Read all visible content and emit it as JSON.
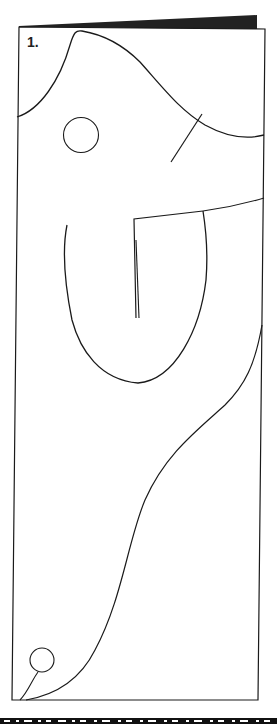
{
  "figure": {
    "label": "1.",
    "stroke_color": "#1a1a1a",
    "panel_shadow_color": "#222222",
    "background": "#ffffff"
  },
  "shapes": [
    {
      "name": "panel-frame",
      "type": "rect"
    },
    {
      "name": "panel-top-shadow",
      "type": "band"
    },
    {
      "name": "head-curve",
      "type": "curve"
    },
    {
      "name": "eye-circle",
      "type": "circle"
    },
    {
      "name": "diagonal-stroke",
      "type": "line"
    },
    {
      "name": "arm-bracket",
      "type": "polyline"
    },
    {
      "name": "inner-vertical-stroke",
      "type": "line"
    },
    {
      "name": "u-curve",
      "type": "curve"
    },
    {
      "name": "tail-curve",
      "type": "curve"
    },
    {
      "name": "small-circle",
      "type": "circle"
    },
    {
      "name": "filmstrip-border",
      "type": "band"
    }
  ]
}
